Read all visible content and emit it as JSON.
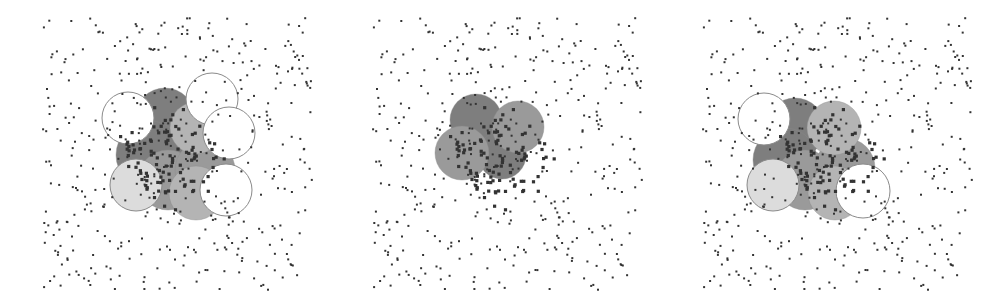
{
  "figure": {
    "colors": {
      "background": "#ffffff",
      "point": "#333333",
      "disk_white": "#ffffff",
      "disk_light": "#dcdcdc",
      "disk_medium": "#b4b4b4",
      "disk_mid_dark": "#9a9a9a",
      "disk_dark": "#7e7e7e",
      "disk_stroke": "#8a8a8a"
    },
    "panels": [
      {
        "id": "panel-left",
        "offset_x": 0,
        "disks": [
          {
            "cx": 165,
            "cy": 118,
            "r": 30,
            "shade": "disk_dark"
          },
          {
            "cx": 150,
            "cy": 155,
            "r": 34,
            "shade": "disk_dark"
          },
          {
            "cx": 168,
            "cy": 180,
            "r": 30,
            "shade": "disk_mid_dark"
          },
          {
            "cx": 205,
            "cy": 170,
            "r": 30,
            "shade": "disk_mid_dark"
          },
          {
            "cx": 196,
            "cy": 128,
            "r": 26,
            "shade": "disk_medium"
          },
          {
            "cx": 136,
            "cy": 185,
            "r": 26,
            "shade": "disk_light"
          },
          {
            "cx": 196,
            "cy": 193,
            "r": 27,
            "shade": "disk_medium"
          },
          {
            "cx": 128,
            "cy": 118,
            "r": 26,
            "shade": "disk_white"
          },
          {
            "cx": 212,
            "cy": 99,
            "r": 26,
            "shade": "disk_white"
          },
          {
            "cx": 229,
            "cy": 133,
            "r": 26,
            "shade": "disk_white"
          },
          {
            "cx": 226,
            "cy": 190,
            "r": 26,
            "shade": "disk_white"
          }
        ]
      },
      {
        "id": "panel-middle",
        "offset_x": 330,
        "disks": [
          {
            "cx": 146,
            "cy": 120,
            "r": 26,
            "shade": "disk_dark"
          },
          {
            "cx": 172,
            "cy": 155,
            "r": 24,
            "shade": "disk_dark"
          },
          {
            "cx": 132,
            "cy": 153,
            "r": 27,
            "shade": "disk_mid_dark"
          },
          {
            "cx": 188,
            "cy": 127,
            "r": 26,
            "shade": "disk_mid_dark"
          }
        ]
      },
      {
        "id": "panel-right",
        "offset_x": 660,
        "disks": [
          {
            "cx": 135,
            "cy": 128,
            "r": 30,
            "shade": "disk_dark"
          },
          {
            "cx": 125,
            "cy": 160,
            "r": 32,
            "shade": "disk_dark"
          },
          {
            "cx": 145,
            "cy": 180,
            "r": 30,
            "shade": "disk_mid_dark"
          },
          {
            "cx": 185,
            "cy": 168,
            "r": 30,
            "shade": "disk_mid_dark"
          },
          {
            "cx": 174,
            "cy": 128,
            "r": 27,
            "shade": "disk_medium"
          },
          {
            "cx": 113,
            "cy": 185,
            "r": 26,
            "shade": "disk_light"
          },
          {
            "cx": 175,
            "cy": 193,
            "r": 27,
            "shade": "disk_medium"
          },
          {
            "cx": 104,
            "cy": 119,
            "r": 26,
            "shade": "disk_white"
          },
          {
            "cx": 203,
            "cy": 191,
            "r": 27,
            "shade": "disk_white"
          }
        ]
      }
    ],
    "points_seed": 7,
    "points_per_panel": 430,
    "points_region": {
      "x0": 42,
      "y0": 18,
      "x1": 312,
      "y1": 290
    },
    "cluster": {
      "cx": 170,
      "cy": 155,
      "spread": 42,
      "count": 110
    }
  }
}
